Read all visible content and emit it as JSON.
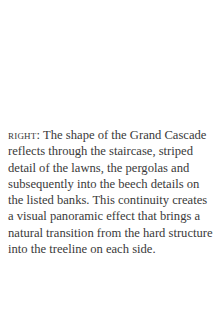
{
  "caption": {
    "label": "RIGHT:",
    "text": " The shape of the Grand Cascade reflects through the staircase, striped detail of the lawns, the pergolas and subsequently into the beech details on the listed banks. This continuity creates a visual panoramic effect that brings a natural transition from the hard structure into the treeline on each side."
  }
}
